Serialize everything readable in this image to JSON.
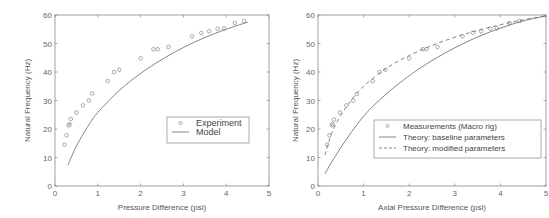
{
  "chart_data": [
    {
      "type": "scatter",
      "title": "",
      "xlabel": "Pressure Difference (psi)",
      "ylabel": "Natural Frequency (Hz)",
      "xlim": [
        0,
        5
      ],
      "ylim": [
        0,
        60
      ],
      "xticks": [
        "0",
        "1",
        "2",
        "3",
        "4",
        "5"
      ],
      "yticks": [
        "0",
        "10",
        "20",
        "30",
        "40",
        "50",
        "60"
      ],
      "grid": false,
      "legend_position": "center-right",
      "series": [
        {
          "name": "Experiment",
          "kind": "markers",
          "marker": "circle",
          "x": [
            0.22,
            0.27,
            0.32,
            0.34,
            0.37,
            0.5,
            0.65,
            0.79,
            0.87,
            1.23,
            1.38,
            1.5,
            2.0,
            2.3,
            2.4,
            2.65,
            3.2,
            3.42,
            3.6,
            3.8,
            3.95,
            4.2,
            4.42
          ],
          "y": [
            14.5,
            17.8,
            21.3,
            21.7,
            23.5,
            25.8,
            28.3,
            30.0,
            32.5,
            36.8,
            40.0,
            40.8,
            44.8,
            48.0,
            48.0,
            48.8,
            52.5,
            53.7,
            54.3,
            55.2,
            55.3,
            57.2,
            57.9
          ]
        },
        {
          "name": "Model",
          "kind": "line",
          "x": [
            0.3,
            0.5,
            0.75,
            1.0,
            1.5,
            2.0,
            2.5,
            3.0,
            3.5,
            4.0,
            4.5
          ],
          "y": [
            7.3,
            14.0,
            20.5,
            25.8,
            33.5,
            39.5,
            44.4,
            48.6,
            52.1,
            55.0,
            57.5
          ]
        }
      ]
    },
    {
      "type": "scatter",
      "title": "",
      "xlabel": "Axial Pressure Difference (psi)",
      "ylabel": "Natural Frequency (Hz)",
      "xlim": [
        0,
        5
      ],
      "ylim": [
        0,
        60
      ],
      "xticks": [
        "0",
        "1",
        "2",
        "3",
        "4",
        "5"
      ],
      "yticks": [
        "0",
        "10",
        "20",
        "30",
        "40",
        "50",
        "60"
      ],
      "grid": false,
      "legend_position": "center-right",
      "series": [
        {
          "name": "Measurements (Macro rig)",
          "kind": "markers",
          "marker": "circle",
          "x": [
            0.2,
            0.25,
            0.3,
            0.32,
            0.35,
            0.48,
            0.62,
            0.77,
            0.85,
            1.2,
            1.35,
            1.48,
            2.0,
            2.3,
            2.38,
            2.62,
            3.17,
            3.4,
            3.58,
            3.78,
            3.92,
            4.2,
            4.42
          ],
          "y": [
            14.5,
            17.8,
            21.3,
            21.7,
            23.3,
            25.8,
            28.3,
            30.0,
            32.3,
            36.8,
            40.0,
            40.8,
            44.8,
            48.0,
            48.0,
            48.8,
            52.5,
            53.8,
            54.3,
            55.2,
            55.3,
            57.2,
            57.9
          ]
        },
        {
          "name": "Theory: baseline parameters",
          "kind": "line",
          "style": "solid",
          "x": [
            0.15,
            0.5,
            1.0,
            1.5,
            2.0,
            2.5,
            3.0,
            3.5,
            4.0,
            4.5,
            5.0
          ],
          "y": [
            4.3,
            13.5,
            24.5,
            32.3,
            38.7,
            44.0,
            48.5,
            52.3,
            55.4,
            57.9,
            59.7
          ]
        },
        {
          "name": "Theory: modified parameters",
          "kind": "line",
          "style": "dashed",
          "x": [
            0.15,
            0.3,
            0.5,
            0.75,
            1.0,
            1.5,
            2.0,
            2.5,
            3.0,
            3.5,
            4.0,
            4.5,
            5.0
          ],
          "y": [
            10.8,
            18.5,
            24.8,
            30.5,
            35.0,
            41.3,
            45.8,
            49.3,
            52.2,
            54.6,
            56.6,
            58.3,
            59.7
          ]
        }
      ]
    }
  ],
  "left_chart": {
    "xlabel": "Pressure Difference (psi)",
    "ylabel": "Natural Frequency (Hz)",
    "legend": [
      "Experiment",
      "Model"
    ]
  },
  "right_chart": {
    "xlabel": "Axial Pressure Difference (psi)",
    "ylabel": "Natural Frequency (Hz)",
    "legend": [
      "Measurements (Macro rig)",
      "Theory: baseline parameters",
      "Theory: modified parameters"
    ]
  },
  "colors": {
    "axis": "#888888",
    "marker": "#888888",
    "line": "#666666",
    "text": "#555555"
  }
}
